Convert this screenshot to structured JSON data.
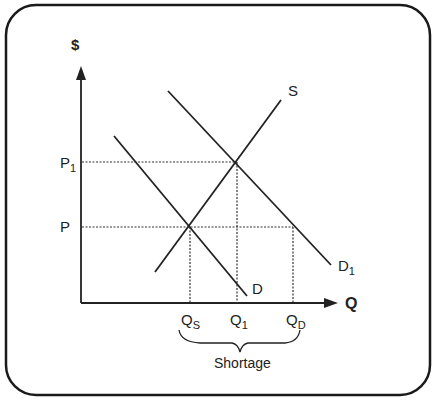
{
  "diagram": {
    "y_axis_label": "$",
    "x_axis_label": "Q",
    "price_labels": {
      "p1": {
        "base": "P",
        "sub": "1"
      },
      "p": {
        "base": "P",
        "sub": ""
      }
    },
    "quantity_labels": {
      "qs": {
        "base": "Q",
        "sub": "S"
      },
      "q1": {
        "base": "Q",
        "sub": "1"
      },
      "qd": {
        "base": "Q",
        "sub": "D"
      }
    },
    "curve_labels": {
      "s": "S",
      "d": "D",
      "d1": {
        "base": "D",
        "sub": "1"
      }
    },
    "brace_label": "Shortage",
    "colors": {
      "line": "#222222",
      "frame": "#1a1a1a",
      "background": "#ffffff"
    }
  }
}
